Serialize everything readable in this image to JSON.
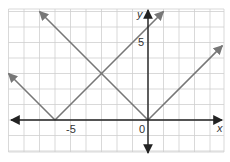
{
  "chart_data": {
    "type": "line",
    "title": "",
    "xlabel": "x",
    "ylabel": "y",
    "xlim": [
      -9,
      4.8
    ],
    "ylim": [
      -2,
      7.1
    ],
    "grid": true,
    "grid_step": 1,
    "origin_label": "0",
    "x_tick_labels": [
      {
        "value": -5,
        "label": "-5"
      }
    ],
    "y_tick_labels": [
      {
        "value": 5,
        "label": "5"
      }
    ],
    "series": [
      {
        "name": "y = |x|",
        "vertex": [
          0,
          0
        ],
        "points": [
          [
            -7,
            7
          ],
          [
            0,
            0
          ],
          [
            4.8,
            4.8
          ]
        ],
        "color": "#777777"
      },
      {
        "name": "y = |x + 6|",
        "vertex": [
          -6,
          0
        ],
        "points": [
          [
            -9,
            3
          ],
          [
            -6,
            0
          ],
          [
            1,
            7
          ]
        ],
        "color": "#777777"
      }
    ],
    "intersection": [
      -3,
      3
    ]
  },
  "colors": {
    "grid": "#cfcfcf",
    "axis": "#222222",
    "curve": "#777777"
  }
}
